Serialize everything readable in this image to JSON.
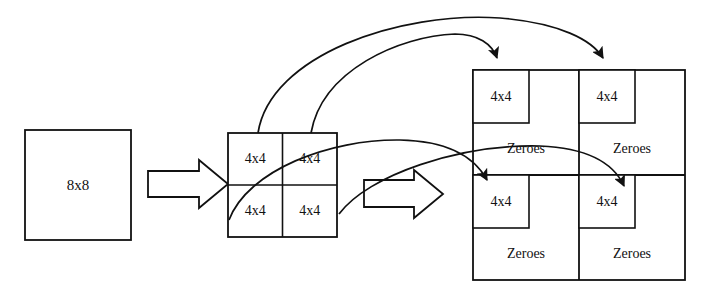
{
  "diagram": {
    "stroke_color": "#111111",
    "fill_color": "#ffffff",
    "background": "#ffffff"
  },
  "source_block": {
    "label": "8x8",
    "x": 25,
    "y": 130,
    "w": 106,
    "h": 110
  },
  "split_grid": {
    "x": 228,
    "y": 133,
    "w": 109,
    "h": 104,
    "cells": [
      {
        "label": "4x4",
        "row": 0,
        "col": 0
      },
      {
        "label": "4x4",
        "row": 0,
        "col": 1
      },
      {
        "label": "4x4",
        "row": 1,
        "col": 0
      },
      {
        "label": "4x4",
        "row": 1,
        "col": 1
      }
    ]
  },
  "padded_block": {
    "x": 473,
    "y": 70,
    "w": 212,
    "h": 210,
    "quadrants": [
      {
        "block_label": "4x4",
        "zeros_label": "Zeroes",
        "row": 0,
        "col": 0
      },
      {
        "block_label": "4x4",
        "zeros_label": "Zeroes",
        "row": 0,
        "col": 1
      },
      {
        "block_label": "4x4",
        "zeros_label": "Zeroes",
        "row": 1,
        "col": 0
      },
      {
        "block_label": "4x4",
        "zeros_label": "Zeroes",
        "row": 1,
        "col": 1
      }
    ]
  },
  "block_arrows": [
    {
      "name": "split-arrow",
      "from": "source_block",
      "to": "split_grid"
    },
    {
      "name": "padding-arrow",
      "from": "split_grid",
      "to": "padded_block"
    }
  ],
  "mapping_arrows": [
    {
      "name": "map-top-left-to-top-left",
      "from_cell": "top-left",
      "to_quadrant": "top-left"
    },
    {
      "name": "map-top-right-to-top-right",
      "from_cell": "top-right",
      "to_quadrant": "top-right"
    },
    {
      "name": "map-bottom-left-to-bottom-left",
      "from_cell": "bottom-left",
      "to_quadrant": "bottom-left"
    },
    {
      "name": "map-bottom-right-to-bottom-right",
      "from_cell": "bottom-right",
      "to_quadrant": "bottom-right"
    }
  ]
}
